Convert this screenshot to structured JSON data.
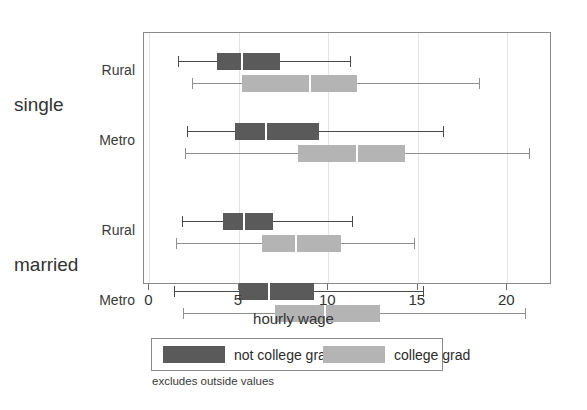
{
  "chart_data": {
    "type": "box",
    "title": "",
    "xlabel": "hourly wage",
    "ylabel": "",
    "xlim": [
      -0.3,
      22.5
    ],
    "xticks": [
      0,
      5,
      10,
      15,
      20
    ],
    "xtick_labels": [
      "0",
      "5",
      "10",
      "15",
      "20"
    ],
    "grid": "vertical-light",
    "legend_position": "below-axis",
    "footnote": "excludes outside values",
    "groups": [
      {
        "label": "single",
        "categories": [
          {
            "label": "Rural",
            "boxes": [
              {
                "series": "not college grad",
                "color": "#5a5a5a",
                "whisker_low": 1.6,
                "q1": 3.8,
                "median": 5.2,
                "q3": 7.3,
                "whisker_high": 11.2
              },
              {
                "series": "college grad",
                "color": "#b4b4b4",
                "whisker_low": 2.4,
                "q1": 5.2,
                "median": 9.0,
                "q3": 11.6,
                "whisker_high": 18.4
              }
            ]
          },
          {
            "label": "Metro",
            "boxes": [
              {
                "series": "not college grad",
                "color": "#5a5a5a",
                "whisker_low": 2.1,
                "q1": 4.8,
                "median": 6.5,
                "q3": 9.5,
                "whisker_high": 16.4
              },
              {
                "series": "college grad",
                "color": "#b4b4b4",
                "whisker_low": 2.0,
                "q1": 8.3,
                "median": 11.6,
                "q3": 14.3,
                "whisker_high": 21.2
              }
            ]
          }
        ]
      },
      {
        "label": "married",
        "categories": [
          {
            "label": "Rural",
            "boxes": [
              {
                "series": "not college grad",
                "color": "#5a5a5a",
                "whisker_low": 1.8,
                "q1": 4.1,
                "median": 5.3,
                "q3": 6.9,
                "whisker_high": 11.3
              },
              {
                "series": "college grad",
                "color": "#b4b4b4",
                "whisker_low": 1.5,
                "q1": 6.3,
                "median": 8.2,
                "q3": 10.7,
                "whisker_high": 14.8
              }
            ]
          },
          {
            "label": "Metro",
            "boxes": [
              {
                "series": "not college grad",
                "color": "#5a5a5a",
                "whisker_low": 1.4,
                "q1": 5.0,
                "median": 6.7,
                "q3": 9.2,
                "whisker_high": 15.3
              },
              {
                "series": "college grad",
                "color": "#b4b4b4",
                "whisker_low": 1.9,
                "q1": 7.0,
                "median": 9.8,
                "q3": 12.9,
                "whisker_high": 21.0
              }
            ]
          }
        ]
      }
    ]
  },
  "axis": {
    "x_title": "hourly wage"
  },
  "legend": {
    "entries": [
      {
        "label": "not college grad",
        "color": "#5a5a5a",
        "swatch": "dark"
      },
      {
        "label": "college grad",
        "color": "#b4b4b4",
        "swatch": "light"
      }
    ]
  },
  "footnote": {
    "text": "excludes outside values"
  }
}
